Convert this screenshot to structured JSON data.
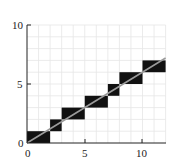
{
  "chart_data": {
    "type": "line",
    "title": "",
    "xlabel": "",
    "ylabel": "",
    "xlim": [
      0,
      12
    ],
    "ylim": [
      0,
      10
    ],
    "xticks": [
      0,
      5,
      10
    ],
    "yticks": [
      0,
      5,
      10
    ],
    "xtick_labels": [
      "0",
      "5",
      "10"
    ],
    "ytick_labels": [
      "0",
      "5",
      "10"
    ],
    "grid": true,
    "grid_step": 1,
    "legend": null,
    "series": [
      {
        "name": "ideal line",
        "type": "line",
        "color": "#9a9a9a",
        "x": [
          0,
          12
        ],
        "y": [
          0,
          7.2
        ]
      }
    ],
    "rasterized_pixels": {
      "color": "#111111",
      "cells": [
        {
          "x0": 0,
          "x1": 2,
          "y0": 0,
          "y1": 1
        },
        {
          "x0": 2,
          "x1": 3,
          "y0": 1,
          "y1": 2
        },
        {
          "x0": 3,
          "x1": 5,
          "y0": 2,
          "y1": 3
        },
        {
          "x0": 5,
          "x1": 7,
          "y0": 3,
          "y1": 4
        },
        {
          "x0": 7,
          "x1": 8,
          "y0": 4,
          "y1": 5
        },
        {
          "x0": 8,
          "x1": 10,
          "y0": 5,
          "y1": 6
        },
        {
          "x0": 10,
          "x1": 12,
          "y0": 6,
          "y1": 7
        }
      ]
    }
  },
  "axes": {
    "tick_labels": {
      "x0": "0",
      "x5": "5",
      "x10": "10",
      "y0": "0",
      "y5": "5",
      "y10": "10"
    }
  }
}
